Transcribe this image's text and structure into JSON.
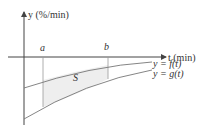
{
  "diagram": {
    "y_axis_label": "y (%/min)",
    "x_axis_label": "t (min)",
    "marker_a": "a",
    "marker_b": "b",
    "region_label": "S",
    "curve_f_label": "y = f(t)",
    "curve_g_label": "y = g(t)",
    "colors": {
      "axis": "#444444",
      "curve": "#777777",
      "shade": "#eeeeee",
      "text": "#333333"
    }
  }
}
